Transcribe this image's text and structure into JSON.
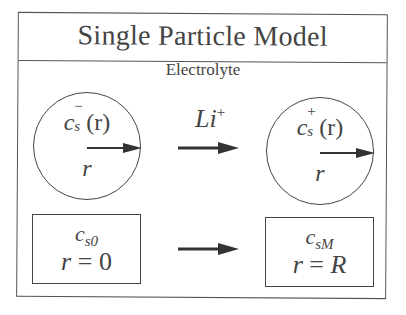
{
  "title": "Single Particle Model",
  "electrolyte_label": "Electrolyte",
  "transfer": {
    "species": "Li",
    "charge": "+"
  },
  "particles": [
    {
      "name": "negative",
      "concentration_symbol": "c",
      "subscript": "s",
      "superscript": "−",
      "argument": "(r)",
      "radius_label": "r"
    },
    {
      "name": "positive",
      "concentration_symbol": "c",
      "subscript": "s",
      "superscript": "+",
      "argument": "(r)",
      "radius_label": "r"
    }
  ],
  "boundary_boxes": [
    {
      "symbol": "c",
      "subscript": "s0",
      "lhs": "r",
      "eq": " = ",
      "rhs": "0"
    },
    {
      "symbol": "c",
      "subscript": "sM",
      "lhs": "r",
      "eq": " = ",
      "rhs": "R"
    }
  ],
  "colors": {
    "line": "#444444",
    "text": "#444444",
    "background": "#ffffff"
  }
}
